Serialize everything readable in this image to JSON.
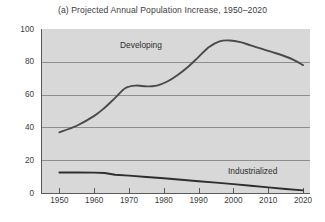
{
  "chart_data": {
    "type": "line",
    "title": "(a) Projected Annual Population Increase, 1950–2020",
    "xlabel": "",
    "ylabel": "Millions",
    "xlim": [
      1945,
      2022
    ],
    "ylim": [
      0,
      100
    ],
    "grid": true,
    "legend_position": "inline-labels",
    "xticks": [
      1950,
      1960,
      1970,
      1980,
      1990,
      2000,
      2010,
      2020
    ],
    "xtick_labels": [
      "1950",
      "1960",
      "1970",
      "1980",
      "1990",
      "2000",
      "2010",
      "2020"
    ],
    "yticks": [
      0,
      20,
      40,
      60,
      80,
      100
    ],
    "ytick_labels": [
      "0",
      "20",
      "40",
      "60",
      "80",
      "100"
    ],
    "series": [
      {
        "name": "Developing",
        "color": "#4a4a4a",
        "label_text": "Developing",
        "x": [
          1950,
          1955,
          1960,
          1963,
          1966,
          1969,
          1972,
          1975,
          1978,
          1981,
          1984,
          1987,
          1990,
          1993,
          1996,
          1999,
          2002,
          2005,
          2008,
          2011,
          2014,
          2017,
          2020
        ],
        "values": [
          37,
          41,
          47,
          52,
          58,
          64,
          65.5,
          65,
          65.5,
          68,
          72,
          77,
          83,
          89,
          92.5,
          93,
          92,
          90,
          88,
          86,
          84,
          81.5,
          78
        ]
      },
      {
        "name": "Industrialized",
        "color": "#2e2e2e",
        "label_text": "Industrialized",
        "x": [
          1950,
          1955,
          1960,
          1963,
          1966,
          1970,
          1975,
          1980,
          1985,
          1990,
          1995,
          2000,
          2005,
          2010,
          2015,
          2020
        ],
        "values": [
          12.5,
          12.5,
          12.4,
          12.2,
          11.1,
          10.6,
          9.8,
          9.0,
          8.1,
          7.2,
          6.3,
          5.4,
          4.4,
          3.4,
          2.4,
          1.6
        ]
      }
    ]
  },
  "axis": {
    "y_title": "Millions"
  }
}
